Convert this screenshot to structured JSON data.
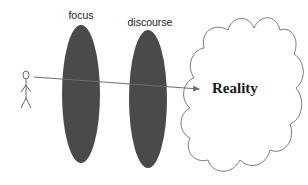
{
  "diagram": {
    "type": "conceptual-flow",
    "colors": {
      "background": "#ffffff",
      "lens_fill": "#4a4a4a",
      "line": "#6e6e6e",
      "cloud_stroke": "#7a7a7a",
      "text": "#1a1a1a"
    },
    "observer": {
      "label": "",
      "icon": "stick-figure-icon"
    },
    "lenses": [
      {
        "label": "focus"
      },
      {
        "label": "discourse"
      }
    ],
    "target": {
      "label": "Reality",
      "shape": "cloud"
    },
    "arrow": {
      "from": "observer",
      "to": "target",
      "passes_through": [
        "focus",
        "discourse"
      ]
    }
  }
}
